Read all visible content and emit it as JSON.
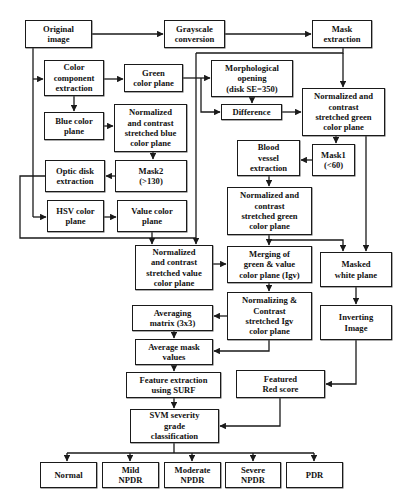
{
  "diagram": {
    "type": "flowchart",
    "title": "",
    "nodes": {
      "original_image": "Original\nimage",
      "grayscale_conversion": "Grayscale\nconversion",
      "mask_extraction": "Mask\nextraction",
      "color_component_extraction": "Color\ncomponent\nextraction",
      "green_color_plane": "Green\ncolor plane",
      "morphological_opening": "Morphological\nopening\n(disk SE=350)",
      "difference": "Difference",
      "normalized_green_top": "Normalized and\ncontrast\nstretched green\ncolor plane",
      "blue_color_plane": "Blue color\nplane",
      "normalized_blue": "Normalized\nand contrast\nstretched blue\ncolor plane",
      "optic_disk_extraction": "Optic disk\nextraction",
      "mask2": "Mask2\n(>130)",
      "mask1": "Mask1\n(<60)",
      "blood_vessel_extraction": "Blood\nvessel\nextraction",
      "hsv_color_plane": "HSV color\nplane",
      "value_color_plane": "Value color\nplane",
      "normalized_green_mid": "Normalized and\ncontrast\nstretched green\ncolor plane",
      "normalized_value": "Normalized\nand contrast\nstretched value\ncolor plane",
      "merging": "Merging of\ngreen & value\ncolor plane (Igv)",
      "masked_white_plane": "Masked\nwhite plane",
      "normalizing_igv": "Normalizing &\nContrast\nstretched Igv\ncolor plane",
      "inverting_image": "Inverting\nImage",
      "averaging_matrix": "Averaging\nmatrix (3x3)",
      "average_mask_values": "Average mask\nvalues",
      "feature_extraction_surf": "Feature extraction\nusing SURF",
      "featured_red_score": "Featured\nRed score",
      "svm_classification": "SVM severity\ngrade\nclassification",
      "class_normal": "Normal",
      "class_mild_npdr": "Mild\nNPDR",
      "class_moderate_npdr": "Moderate\nNPDR",
      "class_severe_npdr": "Severe\nNPDR",
      "class_pdr": "PDR"
    },
    "edges": [
      [
        "Original image",
        "Grayscale conversion"
      ],
      [
        "Grayscale conversion",
        "Mask extraction"
      ],
      [
        "Original image",
        "Color component extraction"
      ],
      [
        "Original image",
        "HSV color plane"
      ],
      [
        "Mask extraction",
        "Normalized and contrast stretched green color plane (top)"
      ],
      [
        "Color component extraction",
        "Green color plane"
      ],
      [
        "Color component extraction",
        "Blue color plane"
      ],
      [
        "Green color plane",
        "Morphological opening"
      ],
      [
        "Green color plane",
        "Difference"
      ],
      [
        "Morphological opening",
        "Difference"
      ],
      [
        "Difference",
        "Normalized and contrast stretched green color plane (top)"
      ],
      [
        "Blue color plane",
        "Normalized and contrast stretched blue color plane"
      ],
      [
        "Normalized and contrast stretched blue color plane",
        "Mask2 (>130)"
      ],
      [
        "Mask2 (>130)",
        "Optic disk extraction"
      ],
      [
        "Optic disk extraction",
        "Normalized and contrast stretched value color plane"
      ],
      [
        "HSV color plane",
        "Value color plane"
      ],
      [
        "Value color plane",
        "Normalized and contrast stretched value color plane"
      ],
      [
        "Green color plane",
        "Normalized and contrast stretched value color plane"
      ],
      [
        "Normalized and contrast stretched green color plane (top)",
        "Mask1 (<60)"
      ],
      [
        "Normalized and contrast stretched green color plane (top)",
        "Masked white plane"
      ],
      [
        "Mask1 (<60)",
        "Blood vessel extraction"
      ],
      [
        "Blood vessel extraction",
        "Normalized and contrast stretched green color plane (mid)"
      ],
      [
        "Normalized and contrast stretched green color plane (mid)",
        "Merging of green & value color plane (Igv)"
      ],
      [
        "Normalized and contrast stretched green color plane (mid)",
        "Masked white plane"
      ],
      [
        "Normalized and contrast stretched value color plane",
        "Merging of green & value color plane (Igv)"
      ],
      [
        "Merging of green & value color plane (Igv)",
        "Normalizing & Contrast stretched Igv color plane"
      ],
      [
        "Normalizing & Contrast stretched Igv color plane",
        "Averaging matrix (3x3)"
      ],
      [
        "Normalizing & Contrast stretched Igv color plane",
        "Average mask values"
      ],
      [
        "Averaging matrix (3x3)",
        "Average mask values"
      ],
      [
        "Average mask values",
        "Feature extraction using SURF"
      ],
      [
        "Masked white plane",
        "Inverting Image"
      ],
      [
        "Inverting Image",
        "Featured Red score"
      ],
      [
        "Feature extraction using SURF",
        "SVM severity grade classification"
      ],
      [
        "Featured Red score",
        "SVM severity grade classification"
      ],
      [
        "SVM severity grade classification",
        "Normal"
      ],
      [
        "SVM severity grade classification",
        "Mild NPDR"
      ],
      [
        "SVM severity grade classification",
        "Moderate NPDR"
      ],
      [
        "SVM severity grade classification",
        "Severe NPDR"
      ],
      [
        "SVM severity grade classification",
        "PDR"
      ]
    ]
  },
  "colors": {
    "stroke": "#1a1a1a",
    "background": "#ffffff",
    "text": "#111111"
  }
}
